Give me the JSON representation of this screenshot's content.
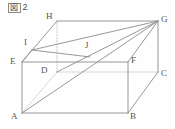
{
  "figure": {
    "caption_mark": "図",
    "caption_number": "2",
    "caption_full": "図 2",
    "kind": "geometry-diagram",
    "shape": "rectangular-cuboid",
    "line_color": "#8c8c8c",
    "hidden_line_color": "#bdbdbd",
    "label_color": "#555555",
    "background_color": "#fefefe"
  },
  "vertices": [
    {
      "name": "A",
      "x": 22,
      "y": 113,
      "label_x": 11,
      "label_y": 112,
      "hidden": false
    },
    {
      "name": "B",
      "x": 128,
      "y": 113,
      "label_x": 130,
      "label_y": 112,
      "hidden": false
    },
    {
      "name": "C",
      "x": 158,
      "y": 72,
      "label_x": 161,
      "label_y": 69,
      "hidden": false
    },
    {
      "name": "D",
      "x": 57,
      "y": 72,
      "label_x": 41,
      "label_y": 66,
      "hidden": true
    },
    {
      "name": "E",
      "x": 22,
      "y": 62,
      "label_x": 10,
      "label_y": 57,
      "hidden": false
    },
    {
      "name": "F",
      "x": 128,
      "y": 62,
      "label_x": 131,
      "label_y": 56,
      "hidden": false
    },
    {
      "name": "G",
      "x": 158,
      "y": 21,
      "label_x": 161,
      "label_y": 15,
      "hidden": false
    },
    {
      "name": "H",
      "x": 57,
      "y": 21,
      "label_x": 46,
      "label_y": 12,
      "hidden": false
    },
    {
      "name": "I",
      "x": 32,
      "y": 50,
      "label_x": 24,
      "label_y": 38,
      "hidden": false
    },
    {
      "name": "J",
      "x": 90,
      "y": 57,
      "label_x": 85,
      "label_y": 41,
      "hidden": false
    }
  ],
  "solid_edges": [
    {
      "from": "A",
      "to": "B"
    },
    {
      "from": "B",
      "to": "C"
    },
    {
      "from": "A",
      "to": "E"
    },
    {
      "from": "B",
      "to": "F"
    },
    {
      "from": "C",
      "to": "G"
    },
    {
      "from": "E",
      "to": "F"
    },
    {
      "from": "F",
      "to": "G"
    },
    {
      "from": "E",
      "to": "H"
    },
    {
      "from": "H",
      "to": "G"
    }
  ],
  "hidden_edges": [
    {
      "from": "D",
      "to": "A"
    },
    {
      "from": "D",
      "to": "C"
    },
    {
      "from": "D",
      "to": "H"
    }
  ],
  "construction_lines": [
    {
      "from": "A",
      "to": "G",
      "style": "solid"
    },
    {
      "from": "D",
      "to": "G",
      "style": "solid"
    },
    {
      "from": "I",
      "to": "G",
      "style": "solid"
    },
    {
      "from": "I",
      "to": "J",
      "style": "solid"
    },
    {
      "from": "E",
      "to": "I",
      "style": "solid"
    }
  ]
}
